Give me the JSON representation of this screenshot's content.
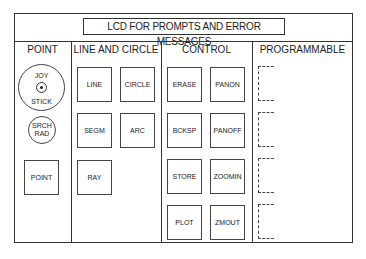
{
  "lcd": {
    "label": "LCD FOR PROMPTS AND ERROR MESSAGES"
  },
  "sections": {
    "point": {
      "title": "POINT",
      "joystick": {
        "top": "JOY",
        "bottom": "STICK"
      },
      "search_radius": {
        "line1": "SRCH",
        "line2": "RAD"
      },
      "buttons": [
        "POINT"
      ]
    },
    "line_and_circle": {
      "title": "LINE AND CIRCLE",
      "buttons": [
        "LINE",
        "CIRCLE",
        "SEGM",
        "ARC",
        "RAY"
      ]
    },
    "control": {
      "title": "CONTROL",
      "buttons": [
        "ERASE",
        "PANON",
        "BCKSP",
        "PANOFF",
        "STORE",
        "ZOOMIN",
        "PLOT",
        "ZMOUT"
      ]
    },
    "programmable": {
      "title": "PROGRAMMABLE",
      "slots": 4
    }
  }
}
